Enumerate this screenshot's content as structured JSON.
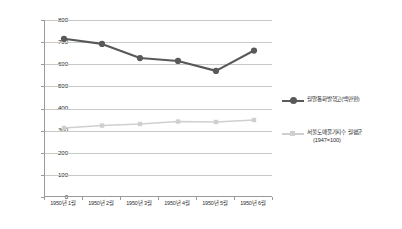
{
  "chart_data": {
    "type": "line",
    "title": "",
    "xlabel": "",
    "ylabel": "",
    "ylim": [
      0,
      800
    ],
    "ytick_step": 100,
    "grid": true,
    "legend_position": "right",
    "categories": [
      "1950년 1월",
      "1950년 2월",
      "1950년 3월",
      "1950년 4월",
      "1950년 5월",
      "1950년 6월"
    ],
    "ytick_labels": [
      "800",
      "700",
      "600",
      "500",
      "400",
      "300",
      "200",
      "100",
      "0"
    ],
    "ytick_values": [
      800,
      700,
      600,
      500,
      400,
      300,
      200,
      100,
      0
    ],
    "series": [
      {
        "name": "월말통화발행고(백만원)",
        "values": [
          715,
          692,
          628,
          615,
          570,
          662
        ],
        "color": "#595959",
        "marker": "circle"
      },
      {
        "name": "서울도매물가지수 월평균",
        "name_sub": "(1947=100)",
        "values": [
          312,
          323,
          330,
          341,
          339,
          348
        ],
        "color": "#cfcfcf",
        "marker": "square"
      }
    ]
  },
  "legend": {
    "items": [
      {
        "label": "월말통화발행고(백만원)",
        "sub": ""
      },
      {
        "label": "서울도매물가지수 월평균",
        "sub": "(1947=100)"
      }
    ]
  },
  "colors": {
    "series_primary": "#595959",
    "series_secondary": "#cfcfcf",
    "gridline": "#c9c9c9",
    "axis": "#9a9a9a",
    "text": "#2b2b2b",
    "background": "#ffffff"
  }
}
